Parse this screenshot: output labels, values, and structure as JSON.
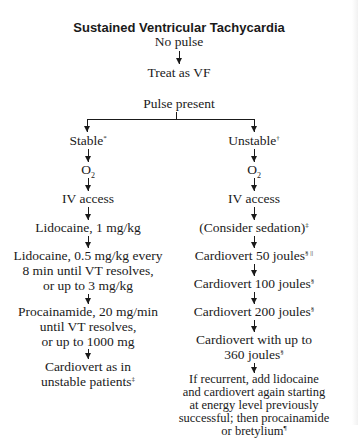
{
  "title": "Sustained Ventricular Tachycardia",
  "no_pulse": {
    "label": "No pulse",
    "action": "Treat as VF"
  },
  "pulse_present": {
    "label": "Pulse present"
  },
  "stable": {
    "label": "Stable",
    "mark": "*",
    "steps": [
      {
        "lines": [
          "O"
        ],
        "sub": "2"
      },
      {
        "lines": [
          "IV access"
        ]
      },
      {
        "lines": [
          "Lidocaine, 1 mg/kg"
        ]
      },
      {
        "lines": [
          "Lidocaine, 0.5 mg/kg every",
          "8 min until VT resolves,",
          "or up to 3 mg/kg"
        ]
      },
      {
        "lines": [
          "Procainamide, 20 mg/min",
          "until VT resolves,",
          "or up to 1000 mg"
        ]
      },
      {
        "lines": [
          "Cardiovert as in",
          "unstable patients"
        ],
        "mark": "‡"
      }
    ]
  },
  "unstable": {
    "label": "Unstable",
    "mark": "†",
    "steps": [
      {
        "lines": [
          "O"
        ],
        "sub": "2"
      },
      {
        "lines": [
          "IV access"
        ]
      },
      {
        "lines": [
          "(Consider sedation)"
        ],
        "mark": "‡"
      },
      {
        "lines": [
          "Cardiovert 50 joules"
        ],
        "mark": "§ ||"
      },
      {
        "lines": [
          "Cardiovert 100 joules"
        ],
        "mark": "§"
      },
      {
        "lines": [
          "Cardiovert 200 joules"
        ],
        "mark": "§"
      },
      {
        "lines": [
          "Cardiovert with up to",
          "360 joules"
        ],
        "mark": "§"
      },
      {
        "lines": [
          "If recurrent, add lidocaine",
          "and cardiovert again starting",
          "at energy level previously",
          "successful; then procainamide",
          "or bretylium"
        ],
        "mark": "¶"
      }
    ]
  }
}
